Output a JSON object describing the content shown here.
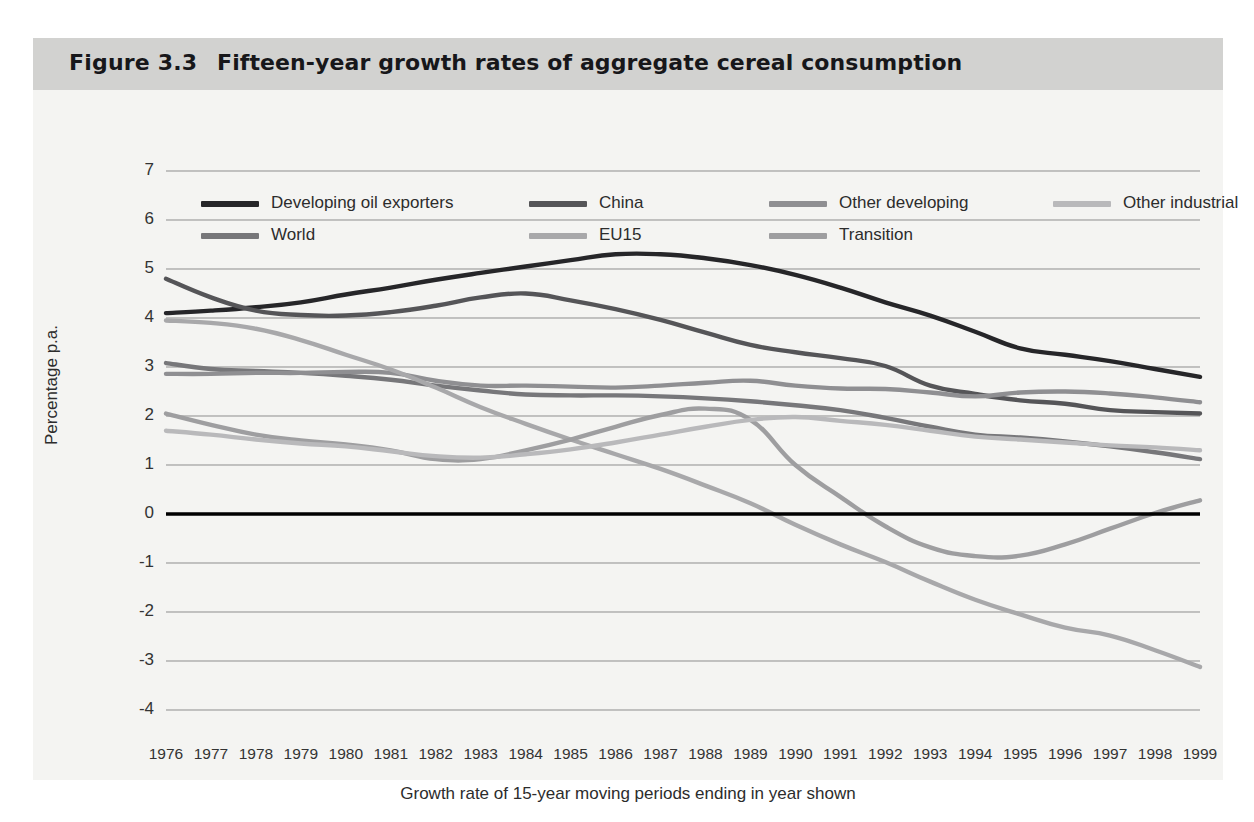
{
  "figure": {
    "number": "Figure 3.3",
    "title": "Fifteen-year growth rates of aggregate cereal consumption"
  },
  "axes": {
    "ylabel": "Percentage p.a.",
    "xcaption": "Growth rate of 15-year moving periods ending in year shown",
    "yticks": [
      "7",
      "6",
      "5",
      "4",
      "3",
      "2",
      "1",
      "0",
      "-1",
      "-2",
      "-3",
      "-4"
    ]
  },
  "colors": {
    "background_page": "#ffffff",
    "background_figure": "#f4f4f2",
    "title_bar": "#d2d2d0",
    "gridline": "#8d8d8d",
    "zero_line": "#000000",
    "developing_oil_exporters": "#262629",
    "china": "#555558",
    "world": "#77777a",
    "other_developing": "#8f8f92",
    "eu15": "#a8a8aa",
    "transition": "#9e9ea0",
    "other_industrial": "#b9b9bb"
  },
  "chart_data": {
    "type": "line",
    "title": "Fifteen-year growth rates of aggregate cereal consumption",
    "xlabel": "Growth rate of 15-year moving periods ending in year shown",
    "ylabel": "Percentage p.a.",
    "xlim": [
      1976,
      1999
    ],
    "ylim": [
      -4,
      7
    ],
    "grid": true,
    "legend_position": "top-inside",
    "x": [
      1976,
      1977,
      1978,
      1979,
      1980,
      1981,
      1982,
      1983,
      1984,
      1985,
      1986,
      1987,
      1988,
      1989,
      1990,
      1991,
      1992,
      1993,
      1994,
      1995,
      1996,
      1997,
      1998,
      1999
    ],
    "series": [
      {
        "name": "Developing oil exporters",
        "color": "#262629",
        "values": [
          4.1,
          4.15,
          4.22,
          4.32,
          4.48,
          4.62,
          4.78,
          4.92,
          5.05,
          5.18,
          5.3,
          5.3,
          5.22,
          5.08,
          4.88,
          4.62,
          4.32,
          4.05,
          3.72,
          3.38,
          3.25,
          3.12,
          2.96,
          2.8
        ]
      },
      {
        "name": "China",
        "color": "#555558",
        "values": [
          4.8,
          4.42,
          4.15,
          4.06,
          4.05,
          4.12,
          4.25,
          4.42,
          4.5,
          4.36,
          4.18,
          3.96,
          3.7,
          3.45,
          3.3,
          3.18,
          3.02,
          2.62,
          2.45,
          2.32,
          2.25,
          2.12,
          2.08,
          2.05
        ]
      },
      {
        "name": "World",
        "color": "#77777a",
        "values": [
          3.08,
          2.96,
          2.92,
          2.88,
          2.82,
          2.74,
          2.62,
          2.52,
          2.44,
          2.42,
          2.42,
          2.4,
          2.36,
          2.3,
          2.22,
          2.12,
          1.96,
          1.78,
          1.62,
          1.56,
          1.48,
          1.38,
          1.26,
          1.12
        ]
      },
      {
        "name": "Other developing",
        "color": "#8f8f92",
        "values": [
          2.86,
          2.86,
          2.88,
          2.88,
          2.9,
          2.88,
          2.72,
          2.62,
          2.62,
          2.6,
          2.58,
          2.62,
          2.68,
          2.72,
          2.62,
          2.56,
          2.55,
          2.48,
          2.4,
          2.48,
          2.5,
          2.46,
          2.38,
          2.28
        ]
      },
      {
        "name": "EU15",
        "color": "#a8a8aa",
        "values": [
          3.95,
          3.9,
          3.78,
          3.55,
          3.25,
          2.95,
          2.58,
          2.18,
          1.84,
          1.52,
          1.22,
          0.92,
          0.58,
          0.22,
          -0.22,
          -0.62,
          -0.98,
          -1.38,
          -1.75,
          -2.05,
          -2.32,
          -2.48,
          -2.78,
          -3.12
        ]
      },
      {
        "name": "Transition",
        "color": "#9e9ea0",
        "values": [
          2.05,
          1.82,
          1.62,
          1.5,
          1.42,
          1.3,
          1.12,
          1.12,
          1.3,
          1.52,
          1.78,
          2.02,
          2.15,
          1.92,
          1.0,
          0.35,
          -0.25,
          -0.68,
          -0.86,
          -0.85,
          -0.62,
          -0.3,
          0.02,
          0.28
        ]
      },
      {
        "name": "Other industrial",
        "color": "#b9b9bb",
        "values": [
          1.7,
          1.62,
          1.52,
          1.44,
          1.38,
          1.28,
          1.18,
          1.15,
          1.22,
          1.32,
          1.46,
          1.62,
          1.78,
          1.92,
          1.98,
          1.9,
          1.82,
          1.7,
          1.58,
          1.52,
          1.46,
          1.4,
          1.36,
          1.3
        ]
      }
    ]
  },
  "legend": [
    {
      "label": "Developing oil exporters",
      "color": "#262629",
      "col": 0,
      "row": 0
    },
    {
      "label": "World",
      "color": "#77777a",
      "col": 0,
      "row": 1
    },
    {
      "label": "China",
      "color": "#555558",
      "col": 1,
      "row": 0
    },
    {
      "label": "EU15",
      "color": "#a8a8aa",
      "col": 1,
      "row": 1
    },
    {
      "label": "Other developing",
      "color": "#8f8f92",
      "col": 2,
      "row": 0
    },
    {
      "label": "Transition",
      "color": "#9e9ea0",
      "col": 2,
      "row": 1
    },
    {
      "label": "Other industrial",
      "color": "#b9b9bb",
      "col": 3,
      "row": 0
    }
  ]
}
